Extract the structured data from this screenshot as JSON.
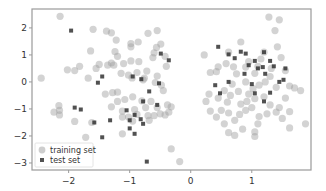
{
  "chart_data": {
    "type": "scatter",
    "title": "",
    "xlabel": "",
    "ylabel": "",
    "xlim": [
      -2.6,
      1.97
    ],
    "ylim": [
      -3.26,
      2.7
    ],
    "grid": false,
    "legend_position": "lower left",
    "xticks": [
      -2,
      -1,
      0,
      1
    ],
    "yticks": [
      -3,
      -2,
      -1,
      0,
      1,
      2
    ],
    "xtick_labels": [
      "−2",
      "−1",
      "0",
      "1"
    ],
    "ytick_labels": [
      "−3",
      "−2",
      "−1",
      "0",
      "1",
      "2"
    ],
    "series": [
      {
        "name": "training set",
        "marker": "circle",
        "color": "#9e9e9e",
        "alpha": 0.45,
        "points": [
          [
            -2.14,
            2.43
          ],
          [
            -1.6,
            1.95
          ],
          [
            -1.38,
            1.88
          ],
          [
            -1.3,
            1.82
          ],
          [
            -1.22,
            1.55
          ],
          [
            -1.64,
            1.15
          ],
          [
            -1.24,
            1.12
          ],
          [
            -1.2,
            0.95
          ],
          [
            -0.98,
            1.42
          ],
          [
            -0.98,
            1.3
          ],
          [
            -0.86,
            1.48
          ],
          [
            -0.7,
            1.8
          ],
          [
            -0.55,
            1.9
          ],
          [
            -0.56,
            1.28
          ],
          [
            -0.49,
            1.4
          ],
          [
            -0.6,
            1.08
          ],
          [
            -0.62,
            0.9
          ],
          [
            -0.85,
            0.75
          ],
          [
            -0.98,
            0.78
          ],
          [
            -1.1,
            0.68
          ],
          [
            -1.3,
            0.7
          ],
          [
            -1.36,
            0.62
          ],
          [
            -1.55,
            0.5
          ],
          [
            -1.5,
            0.65
          ],
          [
            -1.82,
            0.58
          ],
          [
            -1.9,
            0.42
          ],
          [
            -2.02,
            0.45
          ],
          [
            -1.14,
            0.32
          ],
          [
            -1.26,
            0.62
          ],
          [
            -1.02,
            0.25
          ],
          [
            -0.88,
            0.35
          ],
          [
            -0.72,
            0.4
          ],
          [
            -0.76,
            0.14
          ],
          [
            -0.55,
            0.22
          ],
          [
            -0.4,
            0.58
          ],
          [
            -0.42,
            0.95
          ],
          [
            -0.58,
            -0.02
          ],
          [
            -0.78,
            0.08
          ],
          [
            -0.96,
            0.15
          ],
          [
            -2.45,
            0.14
          ],
          [
            -1.68,
            0.14
          ],
          [
            -1.2,
            -0.38
          ],
          [
            -1.28,
            -0.4
          ],
          [
            -0.45,
            -0.32
          ],
          [
            -0.48,
            -0.12
          ],
          [
            -0.95,
            -0.55
          ],
          [
            -0.8,
            -0.7
          ],
          [
            -0.65,
            -0.72
          ],
          [
            -0.55,
            -0.95
          ],
          [
            -0.38,
            -0.85
          ],
          [
            -0.36,
            -1.12
          ],
          [
            -0.32,
            -0.92
          ],
          [
            -1.3,
            -0.92
          ],
          [
            -1.2,
            -0.72
          ],
          [
            -1.08,
            -0.65
          ],
          [
            -0.92,
            -1.02
          ],
          [
            -1.12,
            -1.08
          ],
          [
            -0.88,
            -1.2
          ],
          [
            -1.02,
            -1.3
          ],
          [
            -1.12,
            -1.3
          ],
          [
            -0.95,
            -1.45
          ],
          [
            -0.74,
            -0.95
          ],
          [
            -0.7,
            -1.25
          ],
          [
            -0.68,
            -1.42
          ],
          [
            -0.6,
            -1.25
          ],
          [
            -0.5,
            -1.18
          ],
          [
            -0.42,
            -1.22
          ],
          [
            -2.24,
            -1.12
          ],
          [
            -2.15,
            -1.22
          ],
          [
            -2.16,
            -0.88
          ],
          [
            -2.15,
            -1.05
          ],
          [
            -1.9,
            -1.46
          ],
          [
            -1.62,
            -1.5
          ],
          [
            -1.72,
            -2.05
          ],
          [
            -1.12,
            -1.92
          ],
          [
            -0.32,
            -2.48
          ],
          [
            -1.4,
            -0.45
          ],
          [
            -0.18,
            -2.95
          ],
          [
            0.22,
            1.0
          ],
          [
            0.62,
            1.1
          ],
          [
            0.82,
            1.48
          ],
          [
            0.42,
            0.38
          ],
          [
            0.32,
            0.35
          ],
          [
            0.58,
            0.68
          ],
          [
            0.45,
            0.56
          ],
          [
            0.7,
            0.56
          ],
          [
            0.75,
            0.3
          ],
          [
            0.9,
            0.55
          ],
          [
            0.95,
            0.75
          ],
          [
            1.05,
            0.32
          ],
          [
            1.1,
            0.58
          ],
          [
            1.15,
            0.85
          ],
          [
            1.2,
            1.1
          ],
          [
            1.32,
            0.5
          ],
          [
            1.38,
            1.9
          ],
          [
            1.42,
            1.3
          ],
          [
            1.48,
            0.9
          ],
          [
            1.55,
            0.42
          ],
          [
            1.3,
            0.2
          ],
          [
            1.22,
            0.0
          ],
          [
            1.12,
            -0.12
          ],
          [
            1.02,
            -0.25
          ],
          [
            0.95,
            -0.45
          ],
          [
            1.45,
            2.3
          ],
          [
            1.28,
            2.4
          ],
          [
            0.9,
            0.0
          ],
          [
            0.78,
            -0.35
          ],
          [
            0.68,
            -0.08
          ],
          [
            0.55,
            -0.32
          ],
          [
            0.45,
            -0.6
          ],
          [
            0.6,
            -0.75
          ],
          [
            0.65,
            -0.5
          ],
          [
            0.82,
            -0.82
          ],
          [
            0.92,
            -0.72
          ],
          [
            1.05,
            -0.62
          ],
          [
            1.2,
            -0.55
          ],
          [
            1.3,
            -0.85
          ],
          [
            1.45,
            -0.95
          ],
          [
            1.55,
            -0.6
          ],
          [
            1.62,
            -0.15
          ],
          [
            1.7,
            -0.22
          ],
          [
            1.8,
            -0.32
          ],
          [
            1.4,
            -0.2
          ],
          [
            0.5,
            -1.05
          ],
          [
            0.62,
            -1.15
          ],
          [
            0.72,
            -1.42
          ],
          [
            0.8,
            -1.2
          ],
          [
            0.9,
            -1.05
          ],
          [
            1.0,
            -0.95
          ],
          [
            1.12,
            -1.28
          ],
          [
            1.25,
            -1.18
          ],
          [
            1.4,
            -1.12
          ],
          [
            1.5,
            -1.35
          ],
          [
            1.62,
            -1.1
          ],
          [
            0.32,
            -1.08
          ],
          [
            0.42,
            -1.3
          ],
          [
            0.25,
            -0.72
          ],
          [
            0.72,
            -1.98
          ],
          [
            1.05,
            -2.02
          ],
          [
            0.85,
            -1.75
          ],
          [
            0.55,
            -1.55
          ],
          [
            1.1,
            -1.55
          ],
          [
            1.62,
            -1.7
          ],
          [
            1.88,
            -1.55
          ],
          [
            0.62,
            -1.88
          ],
          [
            0.3,
            -0.45
          ],
          [
            1.05,
            -1.85
          ]
        ]
      },
      {
        "name": "test set",
        "marker": "square",
        "color": "#333333",
        "alpha": 0.85,
        "points": [
          [
            -1.96,
            1.9
          ],
          [
            -1.52,
            -0.03
          ],
          [
            -1.45,
            0.2
          ],
          [
            -0.49,
            1.05
          ],
          [
            -0.36,
            0.8
          ],
          [
            -0.95,
            0.2
          ],
          [
            -0.81,
            0.1
          ],
          [
            -0.52,
            -0.05
          ],
          [
            -0.68,
            -0.35
          ],
          [
            -0.55,
            -0.85
          ],
          [
            -1.05,
            -1.05
          ],
          [
            -1.0,
            -1.42
          ],
          [
            -1.8,
            -1.02
          ],
          [
            -1.58,
            -1.5
          ],
          [
            -1.45,
            -2.05
          ],
          [
            -1.32,
            -1.42
          ],
          [
            -1.0,
            -1.72
          ],
          [
            -0.82,
            -1.38
          ],
          [
            -0.92,
            -1.92
          ],
          [
            -0.78,
            -1.55
          ],
          [
            -0.92,
            -1.22
          ],
          [
            -0.72,
            -2.95
          ],
          [
            -1.9,
            -0.95
          ],
          [
            -0.78,
            -0.72
          ],
          [
            0.45,
            1.3
          ],
          [
            0.62,
            1.02
          ],
          [
            0.72,
            0.88
          ],
          [
            0.82,
            1.12
          ],
          [
            0.9,
            1.05
          ],
          [
            0.95,
            0.62
          ],
          [
            1.05,
            0.78
          ],
          [
            1.1,
            0.5
          ],
          [
            1.18,
            0.55
          ],
          [
            1.22,
            0.3
          ],
          [
            1.3,
            0.78
          ],
          [
            1.36,
            0.58
          ],
          [
            1.52,
            0.08
          ],
          [
            1.45,
            0.0
          ],
          [
            1.3,
            -0.4
          ],
          [
            1.0,
            -0.08
          ],
          [
            0.88,
            0.3
          ],
          [
            0.62,
            0.0
          ],
          [
            1.55,
            0.5
          ],
          [
            1.2,
            1.1
          ],
          [
            0.4,
            -0.12
          ],
          [
            0.48,
            -0.42
          ],
          [
            1.2,
            -0.72
          ],
          [
            1.05,
            -0.42
          ]
        ]
      }
    ]
  },
  "legend": {
    "items": [
      {
        "label": "training set",
        "marker": "circle"
      },
      {
        "label": "test set",
        "marker": "square"
      }
    ]
  }
}
